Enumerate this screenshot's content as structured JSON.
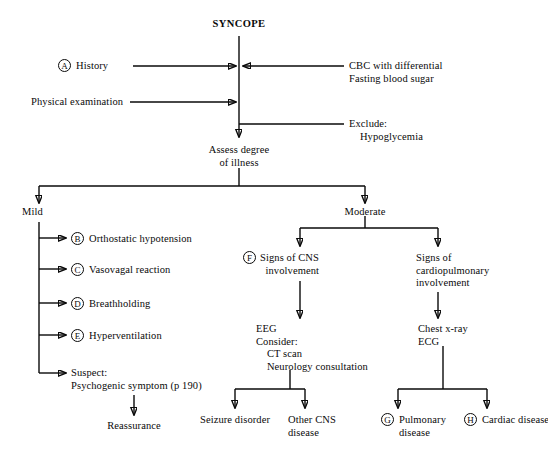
{
  "diagram": {
    "title": "SYNCOPE",
    "root_result": "Assess degree\nof illness",
    "inputs": {
      "history": {
        "marker": "A",
        "label": "History"
      },
      "physical_exam": {
        "label": "Physical examination"
      },
      "labs": {
        "label": "CBC with differential\nFasting blood sugar"
      },
      "exclude": {
        "label": "Exclude:\n    Hypoglycemia"
      }
    },
    "branches": {
      "mild": {
        "label": "Mild"
      },
      "moderate": {
        "label": "Moderate"
      }
    },
    "mild_items": [
      {
        "marker": "B",
        "label": "Orthostatic hypotension"
      },
      {
        "marker": "C",
        "label": "Vasovagal reaction"
      },
      {
        "marker": "D",
        "label": "Breathholding"
      },
      {
        "marker": "E",
        "label": "Hyperventilation"
      },
      {
        "marker": "",
        "label": "Suspect:\nPsychogenic symptom (p 190)"
      }
    ],
    "mild_outcome": {
      "label": "Reassurance"
    },
    "cns": {
      "marker": "F",
      "label": "Signs of CNS\n  involvement",
      "workup": "EEG\nConsider:\n    CT scan\n    Neurology consultation",
      "outcomes": [
        {
          "marker": "",
          "label": "Seizure disorder"
        },
        {
          "marker": "",
          "label": "Other CNS\ndisease"
        }
      ]
    },
    "cardiopulmonary": {
      "marker": "",
      "label": "Signs of\ncardiopulmonary\ninvolvement",
      "workup": "Chest x-ray\nECG",
      "outcomes": [
        {
          "marker": "G",
          "label": "Pulmonary\ndisease"
        },
        {
          "marker": "H",
          "label": "Cardiac disease"
        }
      ]
    },
    "colors": {
      "ink": "#0a0a0a",
      "paper": "#ffffff"
    }
  }
}
